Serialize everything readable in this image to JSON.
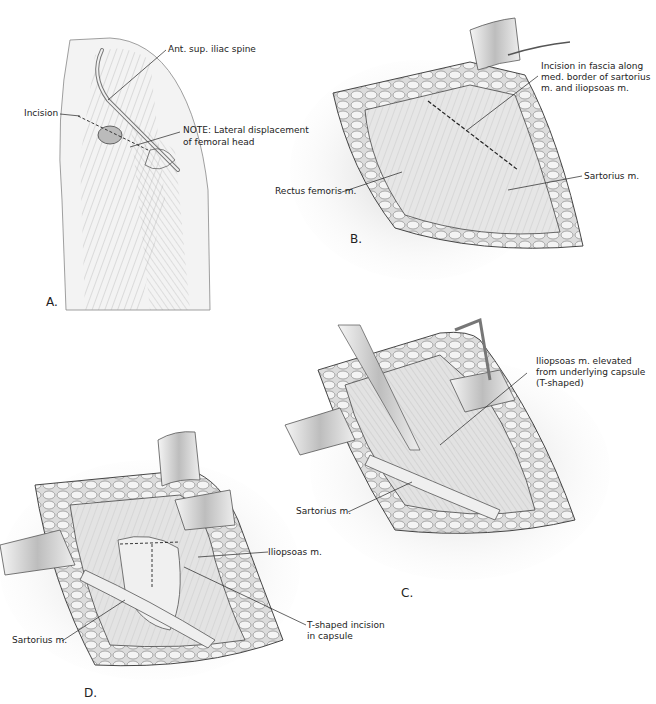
{
  "figure": {
    "panels": [
      {
        "id": "A",
        "letter": "A.",
        "labels": {
          "asis": "Ant. sup. iliac spine",
          "incision": "Incision",
          "note_line1": "NOTE: Lateral displacement",
          "note_line2": "of femoral head"
        }
      },
      {
        "id": "B",
        "letter": "B.",
        "labels": {
          "fascia_line1": "Incision in fascia along",
          "fascia_line2": "med. border of sartorius",
          "fascia_line3": "m. and iliopsoas m.",
          "rectus": "Rectus femoris m.",
          "sartorius": "Sartorius m."
        }
      },
      {
        "id": "C",
        "letter": "C.",
        "labels": {
          "iliopsoas_line1": "Iliopsoas m. elevated",
          "iliopsoas_line2": "from underlying capsule",
          "iliopsoas_line3": "(T-shaped)",
          "sartorius": "Sartorius m."
        }
      },
      {
        "id": "D",
        "letter": "D.",
        "labels": {
          "iliopsoas": "Iliopsoas m.",
          "sartorius": "Sartorius m.",
          "tincision_line1": "T-shaped incision",
          "tincision_line2": "in capsule"
        }
      }
    ],
    "colors": {
      "ink": "#2a2a2a",
      "tissue": "#d9d9d9",
      "fat": "#eeeeee",
      "retractor": "#c8c8c8",
      "background": "#ffffff"
    }
  }
}
